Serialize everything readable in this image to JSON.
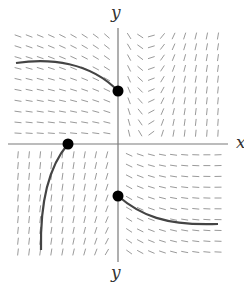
{
  "diagram": {
    "type": "slope-field",
    "labels": {
      "y_top": "y",
      "y_bottom": "y",
      "x_right": "x"
    },
    "colors": {
      "background": "#ffffff",
      "axis": "#7a7a7a",
      "segment": "#9a9a9a",
      "curve": "#444444",
      "dot": "#000000"
    },
    "axes_px": {
      "origin_x": 118,
      "origin_y": 144,
      "x_min": 8,
      "x_max": 228,
      "y_min": 28,
      "y_max": 262
    },
    "field_px": {
      "x_start": 18,
      "x_end": 218,
      "y_start": 36,
      "y_end": 252,
      "cols": 19,
      "rows": 21,
      "segment_length": 7
    },
    "initial_points": [
      {
        "name": "point-upper",
        "x": 118,
        "y": 91
      },
      {
        "name": "point-left",
        "x": 68,
        "y": 144
      },
      {
        "name": "point-lower",
        "x": 118,
        "y": 196
      }
    ],
    "solution_curves": [
      {
        "name": "curve-upper-left",
        "path": "M16,63 C50,58 90,62 118,91"
      },
      {
        "name": "curve-lower-left",
        "path": "M68,144 C50,165 40,200 41,250"
      },
      {
        "name": "curve-lower-right",
        "path": "M118,196 C140,215 165,226 218,224"
      }
    ]
  }
}
